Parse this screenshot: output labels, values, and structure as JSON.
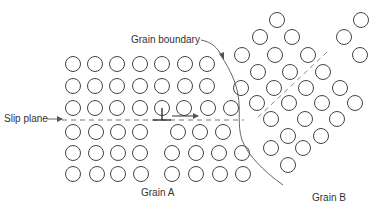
{
  "figure": {
    "type": "schematic",
    "labels": {
      "grain_boundary": "Grain boundary",
      "slip_plane": "Slip plane",
      "grain_a": "Grain A",
      "grain_b": "Grain B"
    },
    "colors": {
      "atom_stroke": "#444444",
      "line": "#555555",
      "dashed": "#777777",
      "text": "#333333",
      "background": "#ffffff"
    },
    "atom_radius": 7.5,
    "grain_a_atoms": [
      [
        73,
        64
      ],
      [
        95,
        64
      ],
      [
        117,
        64
      ],
      [
        140,
        64
      ],
      [
        162,
        64
      ],
      [
        185,
        64
      ],
      [
        207,
        64
      ],
      [
        73,
        86
      ],
      [
        95,
        86
      ],
      [
        117,
        86
      ],
      [
        140,
        86
      ],
      [
        162,
        86
      ],
      [
        185,
        86
      ],
      [
        207,
        86
      ],
      [
        73,
        108
      ],
      [
        95,
        108
      ],
      [
        117,
        108
      ],
      [
        140,
        108
      ],
      [
        162,
        108
      ],
      [
        184,
        108
      ],
      [
        208,
        108
      ],
      [
        231,
        108
      ],
      [
        73,
        132
      ],
      [
        96,
        132
      ],
      [
        118,
        132
      ],
      [
        140,
        132
      ],
      [
        178,
        132
      ],
      [
        200,
        132
      ],
      [
        223,
        132
      ],
      [
        73,
        153
      ],
      [
        96,
        153
      ],
      [
        118,
        153
      ],
      [
        140,
        153
      ],
      [
        172,
        153
      ],
      [
        196,
        153
      ],
      [
        219,
        153
      ],
      [
        242,
        153
      ],
      [
        73,
        174
      ],
      [
        97,
        174
      ],
      [
        118,
        174
      ],
      [
        141,
        174
      ],
      [
        172,
        174
      ],
      [
        196,
        174
      ],
      [
        220,
        174
      ],
      [
        243,
        174
      ]
    ],
    "grain_b_atoms": [
      [
        277,
        20
      ],
      [
        361,
        20
      ],
      [
        260,
        37
      ],
      [
        292,
        37
      ],
      [
        344,
        37
      ],
      [
        242,
        55
      ],
      [
        275,
        55
      ],
      [
        308,
        55
      ],
      [
        360,
        55
      ],
      [
        258,
        72
      ],
      [
        290,
        72
      ],
      [
        323,
        72
      ],
      [
        241,
        88
      ],
      [
        274,
        88
      ],
      [
        306,
        88
      ],
      [
        340,
        88
      ],
      [
        257,
        103
      ],
      [
        289,
        103
      ],
      [
        322,
        103
      ],
      [
        355,
        103
      ],
      [
        271,
        119
      ],
      [
        305,
        119
      ],
      [
        337,
        119
      ],
      [
        288,
        136
      ],
      [
        321,
        136
      ],
      [
        271,
        148
      ],
      [
        303,
        148
      ],
      [
        288,
        165
      ]
    ],
    "slip_plane": {
      "y": 120,
      "x_start": 62,
      "x_end": 244
    },
    "grain_b_slip_plane": {
      "x1": 327,
      "y1": 52,
      "x2": 255,
      "y2": 120
    },
    "dislocation": {
      "x": 162,
      "y": 120,
      "half_width": 9,
      "stem": 12
    },
    "motion_arrow": {
      "x1": 172,
      "y1": 116,
      "x2": 198,
      "y2": 116
    }
  }
}
